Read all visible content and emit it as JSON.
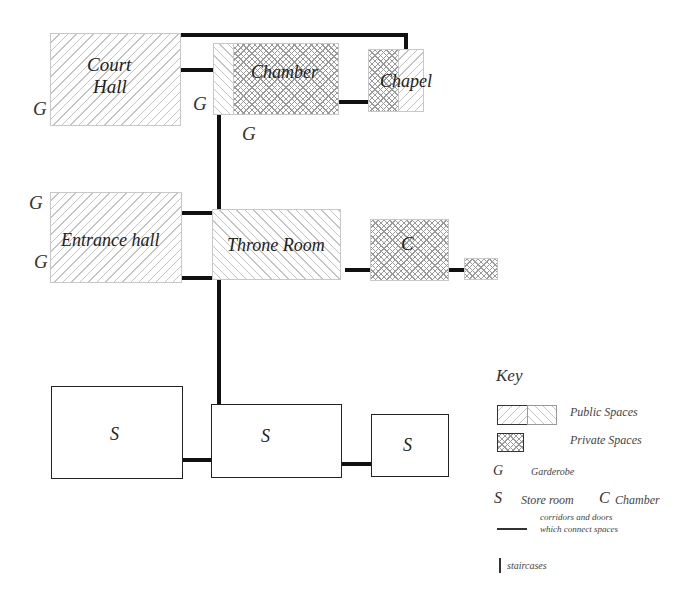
{
  "diagram": {
    "rooms": {
      "court_hall": {
        "line1": "Court",
        "line2": "Hall",
        "type": "public"
      },
      "chamber": {
        "label": "Chamber",
        "type": "private"
      },
      "chapel": {
        "label": "Chapel",
        "type": "private+public"
      },
      "entrance_hall": {
        "label": "Entrance hall",
        "type": "public"
      },
      "throne_room": {
        "label": "Throne Room",
        "type": "public"
      },
      "chamber_c": {
        "label": "C",
        "type": "private"
      },
      "small_private": {
        "label": "",
        "type": "private"
      },
      "store_1": {
        "label": "S",
        "type": "store"
      },
      "store_2": {
        "label": "S",
        "type": "store"
      },
      "store_3": {
        "label": "S",
        "type": "store"
      }
    },
    "garderobes": [
      "G",
      "G",
      "G",
      "G",
      "G"
    ]
  },
  "key": {
    "title": "Key",
    "public_label": "Public Spaces",
    "private_label": "Private Spaces",
    "garderobe_symbol": "G",
    "garderobe_label": "Garderobe",
    "store_symbol": "S",
    "store_label": "Store room",
    "chamber_symbol": "C",
    "chamber_label": "Chamber",
    "corridor_label_1": "corridors and doors",
    "corridor_label_2": "which connect spaces",
    "staircase_label": "staircases"
  },
  "colors": {
    "line": "#111111",
    "hatch": "#c4c4c4",
    "crosshatch": "#9a9a9a"
  }
}
